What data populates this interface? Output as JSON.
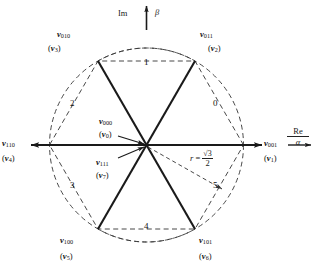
{
  "figure": {
    "type": "space-vector-hexagon",
    "center_label_top": "v000",
    "center_label_bottom": "v111"
  },
  "axes": {
    "real": {
      "name": "Re",
      "symbol": "α",
      "direction": "right"
    },
    "imag": {
      "name": "Im",
      "symbol": "β",
      "direction": "up"
    }
  },
  "radius": {
    "symbol": "r",
    "equals": "=",
    "numerator": "√3",
    "denominator": "2",
    "value_text": "r = √3/2"
  },
  "zero_vectors": [
    {
      "id": "v000",
      "binary": "000",
      "name": "v",
      "sub": "000",
      "alt_name": "v",
      "alt_sub": "0",
      "position": "center-above"
    },
    {
      "id": "v111",
      "binary": "111",
      "name": "v",
      "sub": "111",
      "alt_name": "v",
      "alt_sub": "7",
      "position": "center-below"
    }
  ],
  "vectors": [
    {
      "id": "v001",
      "binary": "001",
      "name": "v",
      "sub": "001",
      "alt_name": "v",
      "alt_sub": "1",
      "angle_deg": 0,
      "position": "right"
    },
    {
      "id": "v011",
      "binary": "011",
      "name": "v",
      "sub": "011",
      "alt_name": "v",
      "alt_sub": "2",
      "angle_deg": 60,
      "position": "top-right"
    },
    {
      "id": "v010",
      "binary": "010",
      "name": "v",
      "sub": "010",
      "alt_name": "v",
      "alt_sub": "3",
      "angle_deg": 120,
      "position": "top-left"
    },
    {
      "id": "v110",
      "binary": "110",
      "name": "v",
      "sub": "110",
      "alt_name": "v",
      "alt_sub": "4",
      "angle_deg": 180,
      "position": "left"
    },
    {
      "id": "v100",
      "binary": "100",
      "name": "v",
      "sub": "100",
      "alt_name": "v",
      "alt_sub": "5",
      "angle_deg": 240,
      "position": "bottom-left"
    },
    {
      "id": "v101",
      "binary": "101",
      "name": "v",
      "sub": "101",
      "alt_name": "v",
      "alt_sub": "6",
      "angle_deg": 300,
      "position": "bottom-right"
    }
  ],
  "sectors": [
    {
      "label": "0",
      "angle_range_deg": [
        0,
        60
      ],
      "x": 213,
      "y": 103
    },
    {
      "label": "1",
      "angle_range_deg": [
        60,
        120
      ],
      "x": 144,
      "y": 62
    },
    {
      "label": "2",
      "angle_range_deg": [
        120,
        180
      ],
      "x": 72,
      "y": 103
    },
    {
      "label": "3",
      "angle_range_deg": [
        180,
        240
      ],
      "x": 72,
      "y": 184
    },
    {
      "label": "4",
      "angle_range_deg": [
        240,
        300
      ],
      "x": 144,
      "y": 225
    },
    {
      "label": "5",
      "angle_range_deg": [
        300,
        360
      ],
      "x": 213,
      "y": 184
    }
  ],
  "colors": {
    "stroke": "#1a1a1a",
    "dashed": "#333333",
    "background": "#ffffff"
  }
}
